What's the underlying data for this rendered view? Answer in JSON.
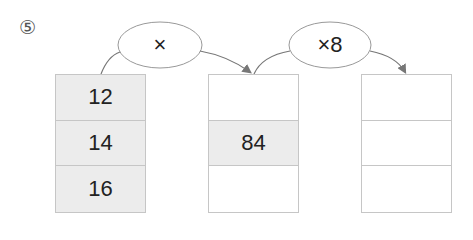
{
  "problem_number": "⑤",
  "operations": [
    {
      "label": "×"
    },
    {
      "label": "×8"
    }
  ],
  "columns": [
    {
      "cells": [
        "12",
        "14",
        "16"
      ],
      "filled": [
        true,
        true,
        true
      ]
    },
    {
      "cells": [
        "",
        "84",
        ""
      ],
      "filled": [
        false,
        true,
        false
      ]
    },
    {
      "cells": [
        "",
        "",
        ""
      ],
      "filled": [
        false,
        false,
        false
      ]
    }
  ],
  "colors": {
    "cell_fill": "#ececec",
    "border": "#c6c6c6",
    "stroke": "#777777"
  }
}
